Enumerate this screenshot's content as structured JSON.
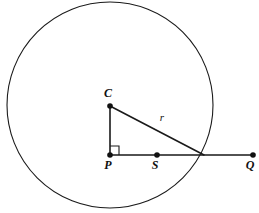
{
  "figure": {
    "kind": "circle-geometry-diagram",
    "background_color": "#ffffff",
    "stroke_color": "#1a1a1a",
    "width": 259,
    "height": 213
  },
  "circle": {
    "name": "main-circle",
    "center_x": 110,
    "center_y": 105,
    "radius": 103,
    "stroke_width": 1.1
  },
  "points": [
    {
      "id": "C",
      "label": "C",
      "x": 110,
      "y": 106,
      "label_x": 108,
      "label_y": 97,
      "role": "center"
    },
    {
      "id": "P",
      "label": "P",
      "x": 110,
      "y": 155,
      "label_x": 108,
      "label_y": 169,
      "role": "foot-of-perpendicular"
    },
    {
      "id": "S",
      "label": "S",
      "x": 157,
      "y": 155,
      "label_x": 155,
      "label_y": 169,
      "role": "point-on-segment"
    },
    {
      "id": "Q",
      "label": "Q",
      "x": 253,
      "y": 155,
      "label_x": 250,
      "label_y": 169,
      "role": "endpoint"
    }
  ],
  "segments": [
    {
      "id": "CP",
      "label": "",
      "x1": 110,
      "y1": 106,
      "x2": 110,
      "y2": 155,
      "stroke_width": 1.6
    },
    {
      "id": "PQ",
      "label": "",
      "x1": 110,
      "y1": 155,
      "x2": 253,
      "y2": 155,
      "stroke_width": 1.6
    },
    {
      "id": "CR",
      "label": "r",
      "x1": 110,
      "y1": 106,
      "x2": 204,
      "y2": 155,
      "stroke_width": 1.6
    }
  ],
  "length_labels": [
    {
      "id": "r",
      "text": "r",
      "x": 162,
      "y": 121
    }
  ],
  "right_angle": {
    "id": "angle-at-P",
    "vertex_x": 110,
    "vertex_y": 155,
    "size": 9,
    "direction": "up-right"
  }
}
